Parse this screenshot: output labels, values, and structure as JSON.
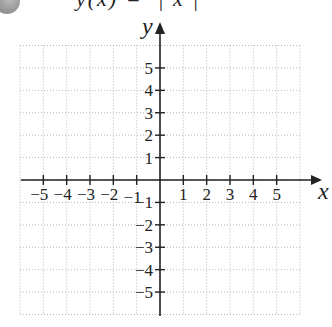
{
  "header": {
    "badge_icon": "circle-badge-icon",
    "equation_fragment": "y(x) =  | x |"
  },
  "chart_data": {
    "type": "table",
    "title": "",
    "xlabel": "x",
    "ylabel": "y",
    "xlim": [
      -6,
      6
    ],
    "ylim": [
      -6,
      6
    ],
    "grid": true,
    "grid_style": "dotted",
    "x_ticks": [
      -5,
      -4,
      -3,
      -2,
      -1,
      1,
      2,
      3,
      4,
      5
    ],
    "y_ticks": [
      -5,
      -4,
      -3,
      -2,
      -1,
      1,
      2,
      3,
      4,
      5
    ],
    "x_tick_labels": [
      "−5",
      "−4",
      "−3",
      "−2",
      "−1",
      "1",
      "2",
      "3",
      "4",
      "5"
    ],
    "y_tick_labels": [
      "−5",
      "−4",
      "−3",
      "−2",
      "−1",
      "1",
      "2",
      "3",
      "4",
      "5"
    ],
    "series": [],
    "colors": {
      "axis": "#222222",
      "grid": "#b8b8b8",
      "text": "#222222"
    }
  }
}
